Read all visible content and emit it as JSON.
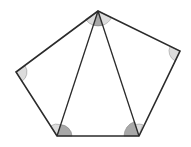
{
  "diagram": {
    "title": "",
    "shape": "pentagon",
    "colors": {
      "stroke": "#2b2b2b",
      "angle_dark": "#a8a8a8",
      "angle_light": "#dcdcdc",
      "background": "#ffffff"
    },
    "vertices": {
      "top": [
        98,
        11
      ],
      "right": [
        180,
        51
      ],
      "bottom_right": [
        139,
        136
      ],
      "bottom_left": [
        57,
        136
      ],
      "left": [
        16,
        72
      ]
    },
    "diagonals": [
      [
        "top",
        "bottom_left"
      ],
      [
        "top",
        "bottom_right"
      ]
    ],
    "triangles": 3,
    "angle_marks": [
      {
        "vertex": "top",
        "shade": "dark",
        "between": [
          "bottom_left",
          "bottom_right"
        ]
      },
      {
        "vertex": "top",
        "shade": "light",
        "between": [
          "left",
          "bottom_left"
        ]
      },
      {
        "vertex": "top",
        "shade": "light",
        "between": [
          "bottom_right",
          "right"
        ]
      },
      {
        "vertex": "right",
        "shade": "light"
      },
      {
        "vertex": "left",
        "shade": "light"
      },
      {
        "vertex": "bottom_left",
        "shade": "dark",
        "between": [
          "bottom_right",
          "top"
        ]
      },
      {
        "vertex": "bottom_left",
        "shade": "light",
        "between": [
          "top",
          "left"
        ]
      },
      {
        "vertex": "bottom_right",
        "shade": "dark",
        "between": [
          "top",
          "bottom_left"
        ]
      },
      {
        "vertex": "bottom_right",
        "shade": "light",
        "between": [
          "right",
          "top"
        ]
      }
    ]
  }
}
